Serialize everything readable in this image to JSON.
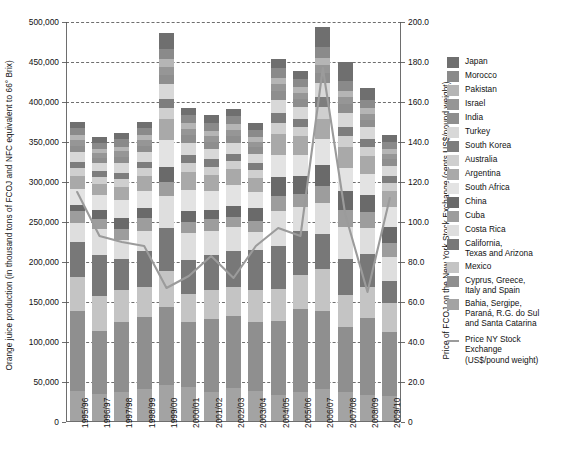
{
  "axes": {
    "y_left_title": "Orange juice production (in thousand tons of FCOJ and NFC equivalent to 66° Brix)",
    "y_right_title": "Price of FCOJ on the New York Stock Exchange (cents US$/pound weight)",
    "y_left_ticks": [
      "500,000",
      "450,000",
      "400,000",
      "350,000",
      "300,000",
      "250,000",
      "200,000",
      "150,000",
      "100,000",
      "50,000",
      "0"
    ],
    "y_right_ticks": [
      "200.0",
      "180.0",
      "160.0",
      "140.0",
      "120.0",
      "100.0",
      "80.0",
      "60.0",
      "40.0",
      "20.0",
      "0"
    ]
  },
  "legend": {
    "items": [
      {
        "label": "Japan",
        "color": "#6f6f6f"
      },
      {
        "label": "Morocco",
        "color": "#8a8a8a"
      },
      {
        "label": "Pakistan",
        "color": "#b5b5b5"
      },
      {
        "label": "Israel",
        "color": "#969696"
      },
      {
        "label": "India",
        "color": "#8e8e8e"
      },
      {
        "label": "Turkey",
        "color": "#d8d8d8"
      },
      {
        "label": "South Korea",
        "color": "#7d7d7d"
      },
      {
        "label": "Australia",
        "color": "#cfcfcf"
      },
      {
        "label": "Argentina",
        "color": "#a9a9a9"
      },
      {
        "label": "South Africa",
        "color": "#e3e3e3"
      },
      {
        "label": "China",
        "color": "#6a6a6a"
      },
      {
        "label": "Cuba",
        "color": "#9d9d9d"
      },
      {
        "label": "Costa Rica",
        "color": "#dedede"
      },
      {
        "label": "California,\nTexas and Arizona",
        "color": "#787878"
      },
      {
        "label": "Mexico",
        "color": "#c4c4c4"
      },
      {
        "label": "Cyprus, Greece,\nItaly and Spain",
        "color": "#8f8f8f"
      },
      {
        "label": "Bahia, Sergipe,\nParaná, R.G. do Sul\nand Santa Catarina",
        "color": "#a3a3a3"
      }
    ],
    "line_entry": "Price NY Stock\nExchange\n(US$/pound weight)"
  },
  "chart_data": {
    "type": "bar",
    "title": "",
    "xlabel": "",
    "ylabel": "Orange juice production (in thousand tons of FCOJ and NFC equivalent to 66° Brix)",
    "ylabel_right": "Price of FCOJ on the New York Stock Exchange (cents US$/pound weight)",
    "ylim": [
      0,
      500000
    ],
    "ylim_right": [
      0,
      200.0
    ],
    "ytick_step": 50000,
    "ytick_step_right": 20.0,
    "grid": true,
    "legend_position": "right",
    "stacked": true,
    "categories": [
      "1995/96",
      "1996/97",
      "1997/98",
      "1998/99",
      "1999/00",
      "2000/01",
      "2001/02",
      "2002/03",
      "2003/04",
      "2004/05",
      "2005/06",
      "2006/07",
      "2007/08",
      "2008/09",
      "2009/10"
    ],
    "series": [
      {
        "name": "Bahia, Sergipe, Paraná, R.G. do Sul and Santa Catarina",
        "color": "#a3a3a3",
        "values": [
          38000,
          34000,
          36000,
          40000,
          45000,
          42000,
          36000,
          41000,
          38000,
          32000,
          36000,
          40000,
          36000,
          33000,
          31000
        ]
      },
      {
        "name": "Cyprus, Greece, Italy and Spain",
        "color": "#8f8f8f",
        "values": [
          100000,
          78000,
          88000,
          90000,
          98000,
          82000,
          92000,
          90000,
          86000,
          93000,
          104000,
          98000,
          82000,
          96000,
          80000
        ]
      },
      {
        "name": "Mexico",
        "color": "#c4c4c4",
        "values": [
          42000,
          44000,
          40000,
          38000,
          44000,
          35000,
          36000,
          36000,
          40000,
          40000,
          42000,
          52000,
          40000,
          38000,
          36000
        ]
      },
      {
        "name": "California, Texas and Arizona",
        "color": "#787878",
        "values": [
          44000,
          52000,
          38000,
          44000,
          54000,
          42000,
          44000,
          46000,
          50000,
          54000,
          56000,
          44000,
          44000,
          42000,
          28000
        ]
      },
      {
        "name": "Costa Rica",
        "color": "#dedede",
        "values": [
          24000,
          32000,
          24000,
          26000,
          40000,
          34000,
          30000,
          30000,
          22000,
          44000,
          30000,
          38000,
          40000,
          32000,
          30000
        ]
      },
      {
        "name": "Cuba",
        "color": "#9d9d9d",
        "values": [
          14000,
          12000,
          14000,
          16000,
          18000,
          14000,
          14000,
          12000,
          14000,
          18000,
          16000,
          22000,
          22000,
          20000,
          18000
        ]
      },
      {
        "name": "China",
        "color": "#6a6a6a",
        "values": [
          8000,
          12000,
          14000,
          12000,
          18000,
          14000,
          12000,
          14000,
          16000,
          24000,
          22000,
          26000,
          24000,
          22000,
          20000
        ]
      },
      {
        "name": "South Africa",
        "color": "#e3e3e3",
        "values": [
          20000,
          18000,
          22000,
          22000,
          34000,
          26000,
          24000,
          26000,
          20000,
          28000,
          26000,
          32000,
          28000,
          26000,
          24000
        ]
      },
      {
        "name": "Argentina",
        "color": "#a9a9a9",
        "values": [
          16000,
          14000,
          16000,
          18000,
          26000,
          22000,
          20000,
          20000,
          18000,
          26000,
          24000,
          26000,
          26000,
          22000,
          20000
        ]
      },
      {
        "name": "Australia",
        "color": "#cfcfcf",
        "values": [
          10000,
          9000,
          10000,
          10000,
          14000,
          12000,
          10000,
          10000,
          10000,
          14000,
          12000,
          14000,
          14000,
          12000,
          10000
        ]
      },
      {
        "name": "South Korea",
        "color": "#7d7d7d",
        "values": [
          8000,
          7000,
          8000,
          8000,
          12000,
          10000,
          9000,
          9000,
          8000,
          12000,
          10000,
          13000,
          12000,
          10000,
          9000
        ]
      },
      {
        "name": "Turkey",
        "color": "#d8d8d8",
        "values": [
          12000,
          10000,
          12000,
          12000,
          18000,
          14000,
          13000,
          13000,
          12000,
          16000,
          14000,
          18000,
          17000,
          14000,
          13000
        ]
      },
      {
        "name": "India",
        "color": "#8e8e8e",
        "values": [
          8000,
          7000,
          8000,
          8000,
          12000,
          10000,
          9000,
          9000,
          8000,
          11000,
          10000,
          12000,
          11000,
          9000,
          8000
        ]
      },
      {
        "name": "Israel",
        "color": "#969696",
        "values": [
          7000,
          6000,
          7000,
          7000,
          10000,
          8000,
          7000,
          8000,
          7000,
          9000,
          8000,
          10000,
          9000,
          8000,
          7000
        ]
      },
      {
        "name": "Pakistan",
        "color": "#b5b5b5",
        "values": [
          6000,
          5000,
          6000,
          6000,
          9000,
          7000,
          7000,
          7000,
          6000,
          8000,
          7000,
          9000,
          8000,
          7000,
          6000
        ]
      },
      {
        "name": "Morocco",
        "color": "#8a8a8a",
        "values": [
          9000,
          8000,
          9000,
          9000,
          13000,
          10000,
          10000,
          10000,
          9000,
          12000,
          11000,
          13000,
          12000,
          10000,
          9000
        ]
      },
      {
        "name": "Japan",
        "color": "#6f6f6f",
        "values": [
          8000,
          7000,
          8000,
          8000,
          20000,
          9000,
          9000,
          9000,
          8000,
          11000,
          10000,
          26000,
          24000,
          15000,
          8000
        ]
      }
    ],
    "line_series": {
      "name": "Price NY Stock Exchange (US$/pound weight)",
      "color": "#9b9b9b",
      "axis": "right",
      "values": [
        115,
        93,
        90,
        88,
        67,
        73,
        83,
        72,
        88,
        97,
        93,
        177,
        104,
        65,
        112
      ]
    }
  }
}
